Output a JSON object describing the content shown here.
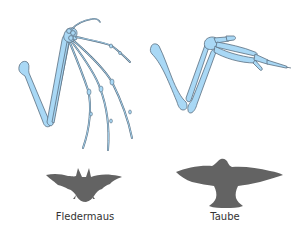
{
  "diagram": {
    "type": "homology-comparison",
    "colors": {
      "bone_fill": "#a9d8f5",
      "bone_stroke": "#5a6f80",
      "silhouette": "#636363",
      "label_text": "#333333",
      "background": "#ffffff"
    },
    "panels": [
      {
        "id": "bat",
        "label": "Fledermaus",
        "skeleton_bones": [
          "humerus",
          "radius",
          "carpals",
          "thumb",
          "digit-2",
          "digit-3",
          "digit-4",
          "digit-5"
        ],
        "silhouette": "bat-silhouette"
      },
      {
        "id": "bird",
        "label": "Taube",
        "skeleton_bones": [
          "humerus",
          "radius",
          "ulna",
          "carpals",
          "carpometacarpus",
          "digits"
        ],
        "silhouette": "pigeon-silhouette"
      }
    ]
  }
}
